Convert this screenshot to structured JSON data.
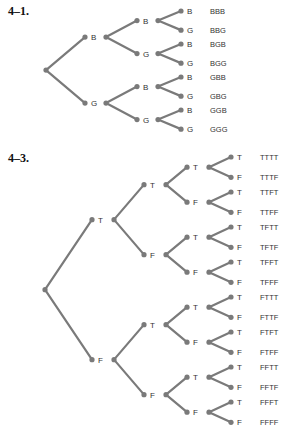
{
  "problems": [
    {
      "heading": "4–1.",
      "levels": 3,
      "branch_labels": [
        "B",
        "G"
      ],
      "outcomes": [
        "BBB",
        "BBG",
        "BGB",
        "BGG",
        "GBB",
        "GBG",
        "GGB",
        "GGG"
      ]
    },
    {
      "heading": "4–3.",
      "levels": 4,
      "branch_labels": [
        "T",
        "F"
      ],
      "outcomes": [
        "TTTT",
        "TTTF",
        "TTFT",
        "TTFF",
        "TFTT",
        "TFTF",
        "TFFT",
        "TFFF",
        "FTTT",
        "FTTF",
        "FTFT",
        "FTFF",
        "FFTT",
        "FFTF",
        "FFFT",
        "FFFF"
      ]
    }
  ],
  "colors": {
    "line": "#7a7a7a",
    "text": "#333333"
  }
}
